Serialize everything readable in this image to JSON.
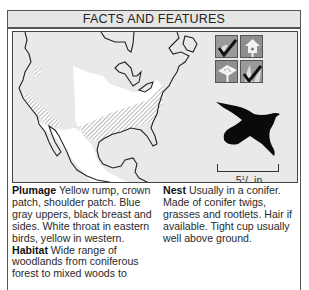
{
  "header": {
    "title": "FACTS AND FEATURES"
  },
  "map": {
    "region": "North America",
    "legend_shading": [
      "white: breeding/summer range",
      "hatched: year-round range",
      "gray: not present"
    ]
  },
  "icons": [
    {
      "name": "feeder-plants-checked",
      "checked": true
    },
    {
      "name": "nest-box",
      "checked": false
    },
    {
      "name": "bird-table",
      "checked": false
    },
    {
      "name": "shrubs-checked",
      "checked": true
    }
  ],
  "size": {
    "label_whole": "5",
    "label_num": "1",
    "label_den": "2",
    "label_unit": "in"
  },
  "text": {
    "plumage": {
      "term": "Plumage",
      "body": " Yellow rump, crown patch, shoulder patch. Blue gray uppers, black breast and sides. White throat in eastern birds, yellow in western."
    },
    "habitat": {
      "term": "Habitat",
      "body": " Wide range of woodlands from coniferous forest to mixed woods to"
    },
    "nest": {
      "term": "Nest",
      "body": " Usually in a conifer. Made of conifer twigs, grasses and rootlets. Hair if available. Tight cup usually well above ground."
    }
  },
  "colors": {
    "header_bg": "#e6e6e6",
    "map_bg": "#e9e9e9",
    "icon_bg": "#8e8e8e",
    "border": "#555555"
  }
}
